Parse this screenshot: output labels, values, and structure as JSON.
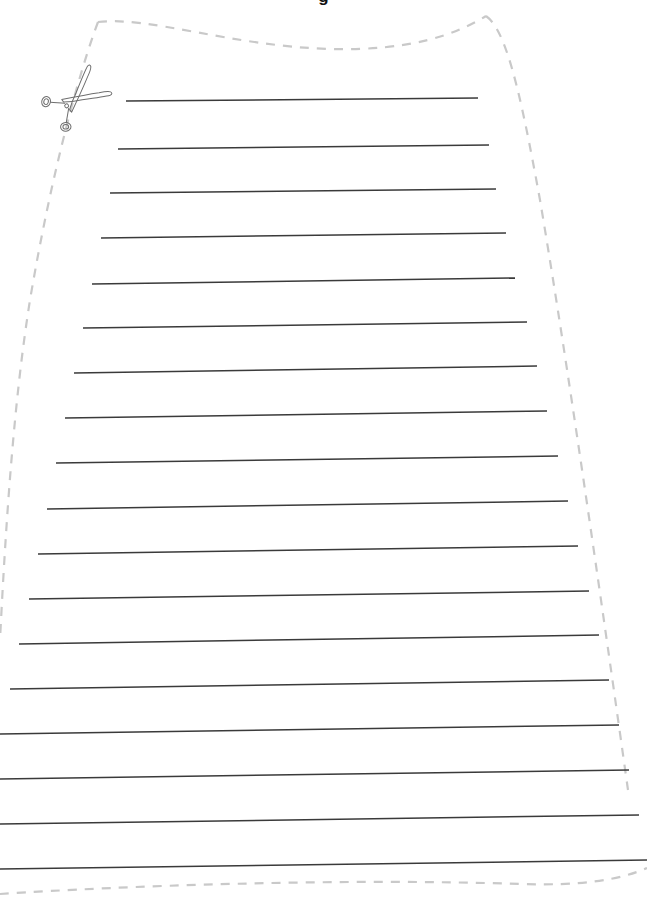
{
  "document": {
    "type": "worksheet",
    "title_partial": "g",
    "title_note": "title is cropped off at the very top edge of the page; only the bottom of one bold glyph is visible",
    "background_color": "#ffffff"
  },
  "cut_guide": {
    "name": "dashed-cut-line",
    "color": "#c9c9c9",
    "style": "dashed",
    "dash_pattern": "9 8",
    "stroke_width": 2.2,
    "shape": "tapered trapezoid / skirt outline, narrow at top with a gently dipping curved top edge, flaring wider toward the bottom, closed by a dashed line across the bottom"
  },
  "scissors_icon": {
    "name": "scissors-icon",
    "color": "#6e6e6e",
    "x": 78,
    "y": 97,
    "rotation_deg": -38,
    "description": "outline scissors drawn on the cut line at upper-left, indicating where to cut"
  },
  "writing_lines": {
    "name": "writing-lines",
    "count": 18,
    "color": "#3a3a3a",
    "stroke_width": 1.5,
    "spacing_px": 45,
    "lines": [
      {
        "index": 1,
        "x1": 126,
        "y1": 101,
        "x2": 478,
        "y2": 98
      },
      {
        "index": 2,
        "x1": 118,
        "y1": 149,
        "x2": 489,
        "y2": 145
      },
      {
        "index": 3,
        "x1": 110,
        "y1": 193,
        "x2": 496,
        "y2": 189
      },
      {
        "index": 4,
        "x1": 101,
        "y1": 238,
        "x2": 506,
        "y2": 233
      },
      {
        "index": 5,
        "x1": 92,
        "y1": 284,
        "x2": 515,
        "y2": 278
      },
      {
        "index": 6,
        "x1": 83,
        "y1": 328,
        "x2": 527,
        "y2": 322
      },
      {
        "index": 7,
        "x1": 74,
        "y1": 373,
        "x2": 537,
        "y2": 366
      },
      {
        "index": 8,
        "x1": 65,
        "y1": 418,
        "x2": 547,
        "y2": 411
      },
      {
        "index": 9,
        "x1": 56,
        "y1": 463,
        "x2": 558,
        "y2": 456
      },
      {
        "index": 10,
        "x1": 47,
        "y1": 509,
        "x2": 568,
        "y2": 501
      },
      {
        "index": 11,
        "x1": 38,
        "y1": 554,
        "x2": 578,
        "y2": 546
      },
      {
        "index": 12,
        "x1": 29,
        "y1": 599,
        "x2": 589,
        "y2": 591
      },
      {
        "index": 13,
        "x1": 19,
        "y1": 644,
        "x2": 599,
        "y2": 635
      },
      {
        "index": 14,
        "x1": 10,
        "y1": 689,
        "x2": 609,
        "y2": 680
      },
      {
        "index": 15,
        "x1": 0,
        "y1": 734,
        "x2": 619,
        "y2": 725
      },
      {
        "index": 16,
        "x1": 0,
        "y1": 779,
        "x2": 629,
        "y2": 770
      },
      {
        "index": 17,
        "x1": 0,
        "y1": 824,
        "x2": 639,
        "y2": 815
      },
      {
        "index": 18,
        "x1": 0,
        "y1": 869,
        "x2": 647,
        "y2": 860
      }
    ]
  },
  "page": {
    "width": 647,
    "height": 904
  }
}
